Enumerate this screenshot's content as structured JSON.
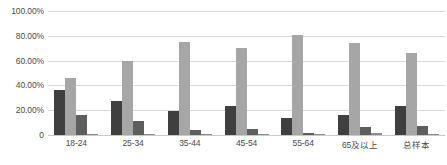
{
  "chart_data": {
    "type": "bar",
    "title": "",
    "subtitle": "",
    "xlabel": "",
    "ylabel": "",
    "ylim": [
      0,
      100
    ],
    "grid": true,
    "legend": "none",
    "orientation": "vertical",
    "grouping": "clustered",
    "categories": [
      "18-24",
      "25-34",
      "35-44",
      "45-54",
      "55-64",
      "65及以上",
      "总样本"
    ],
    "ytick_labels": [
      "100.00%",
      "80.00%",
      "60.00%",
      "40.00%",
      "20.00%",
      "0"
    ],
    "ytick_values": [
      100,
      80,
      60,
      40,
      20,
      0
    ],
    "series": [
      {
        "name": "series-1",
        "color": "#3f3f3f",
        "values": [
          36.0,
          27.5,
          19.5,
          23.0,
          14.0,
          16.5,
          23.5
        ]
      },
      {
        "name": "series-2",
        "color": "#a6a6a6",
        "values": [
          46.0,
          59.5,
          75.0,
          70.0,
          81.0,
          74.0,
          66.0
        ]
      },
      {
        "name": "series-3",
        "color": "#5e5e5e",
        "values": [
          16.5,
          11.5,
          4.0,
          5.0,
          2.0,
          6.5,
          7.5
        ]
      },
      {
        "name": "series-4",
        "color": "#8c8c8c",
        "values": [
          0.5,
          0.5,
          0.3,
          0.3,
          1.0,
          1.5,
          0.5
        ]
      }
    ]
  },
  "colors": {
    "background": "#ffffff",
    "gridline": "#d9d9d9",
    "axis_text": "#4a4a4a"
  }
}
